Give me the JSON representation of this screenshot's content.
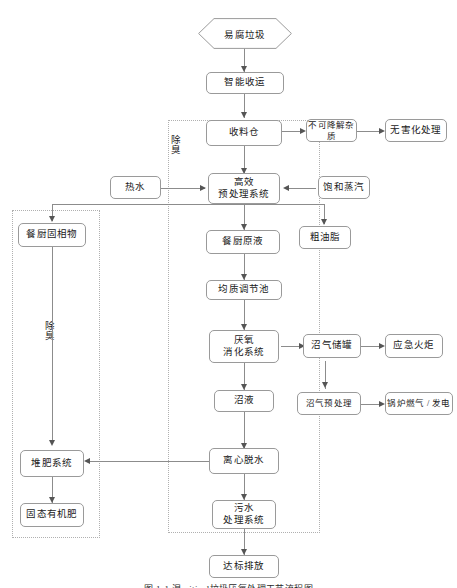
{
  "figure": {
    "caption": "图 1-1   湿critical垃圾厌氧处理工艺流程图",
    "deodorize_label_main": "除臭",
    "deodorize_label_left": "除臭"
  },
  "nodes": {
    "input_waste": "易腐垃圾",
    "smart_collection": "智能收运",
    "receiving_bin": "收料仓",
    "non_degradable": "不可降解杂质",
    "harmless_treatment": "无害化处理",
    "hot_water": "热水",
    "pretreatment_system": "高效\n预处理系统",
    "saturated_steam": "饱和蒸汽",
    "kitchen_raw_liquid": "餐厨原液",
    "crude_grease": "粗油脂",
    "kitchen_solids": "餐厨固相物",
    "homogenization_tank": "均质调节池",
    "anaerobic_digestion": "厌氧\n消化系统",
    "biogas_tank": "沼气储罐",
    "emergency_flare": "应急火炬",
    "biogas_pretreatment": "沼气预处理",
    "boiler_gas_power": "锅炉燃气 / 发电",
    "biogas_slurry": "沼液",
    "centrifugal_dewater": "离心脱水",
    "composting_system": "堆肥系统",
    "solid_organic_fert": "固态有机肥",
    "wastewater_system": "污水\n处理系统",
    "compliant_discharge": "达标排放"
  },
  "colors": {
    "node_border": "#9a9a9a",
    "line": "#8c8c8c",
    "arrow": "#555555",
    "dash_border": "#b0b0b0",
    "text": "#1a1a1a",
    "background": "#ffffff"
  }
}
